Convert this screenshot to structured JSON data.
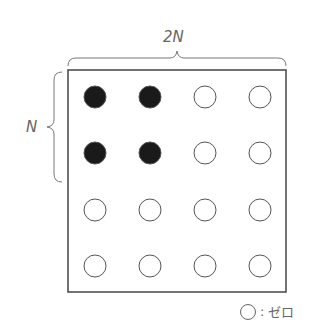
{
  "labels": {
    "top": "2N",
    "left": "N"
  },
  "legend": {
    "symbol": "open-circle",
    "separator": ":",
    "text": "ゼロ"
  },
  "grid": {
    "rows": 4,
    "cols": 4,
    "cells": [
      [
        "filled",
        "filled",
        "open",
        "open"
      ],
      [
        "filled",
        "filled",
        "open",
        "open"
      ],
      [
        "open",
        "open",
        "open",
        "open"
      ],
      [
        "open",
        "open",
        "open",
        "open"
      ]
    ]
  },
  "colors": {
    "filled": "#1a1a1a",
    "stroke": "#555555"
  }
}
